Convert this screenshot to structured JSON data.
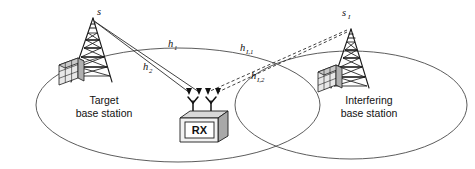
{
  "diagram": {
    "background_color": "#ffffff",
    "line_color": "#2b2b2b",
    "cell_color": "#4a4a4a"
  },
  "cells": [
    {
      "id": "target-cell",
      "label_line1": "Target",
      "label_line2": "base station"
    },
    {
      "id": "interfering-cell",
      "label_line1": "Interfering",
      "label_line2": "base station"
    }
  ],
  "sources": [
    {
      "id": "target-source",
      "symbol": "s",
      "subscript": ""
    },
    {
      "id": "interfering-source",
      "symbol": "s",
      "subscript": "I"
    }
  ],
  "channels": [
    {
      "id": "h1",
      "symbol": "h",
      "subscript": "1",
      "style": "solid",
      "from": "target-source",
      "to": "receiver"
    },
    {
      "id": "h2",
      "symbol": "h",
      "subscript": "2",
      "style": "solid",
      "from": "target-source",
      "to": "receiver"
    },
    {
      "id": "hI1",
      "symbol": "h",
      "subscript": "I,1",
      "style": "dashed",
      "from": "interfering-source",
      "to": "receiver"
    },
    {
      "id": "hI2",
      "symbol": "h",
      "subscript": "I,2",
      "style": "dashed",
      "from": "interfering-source",
      "to": "receiver"
    }
  ],
  "receiver": {
    "label": "RX",
    "antenna_count": 2,
    "incoming_arrow_count": 4
  },
  "icons": {
    "tower": "antenna-tower-icon",
    "building": "building-icon",
    "receiver_box": "receiver-box-icon",
    "antenna": "dipole-antenna-icon",
    "arrow": "arrowhead-icon"
  }
}
